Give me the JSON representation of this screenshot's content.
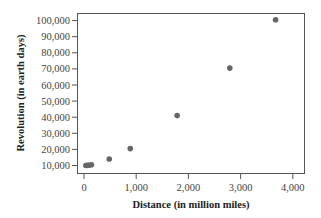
{
  "chart_data": {
    "type": "scatter",
    "title": "",
    "xlabel": "Distance (in million miles)",
    "ylabel": "Revolution (in earth days)",
    "xlim": [
      -100,
      4200
    ],
    "ylim": [
      5000,
      105000
    ],
    "grid": false,
    "legend": null,
    "x_ticks": [
      0,
      1000,
      2000,
      3000,
      4000
    ],
    "x_tick_labels": [
      "0",
      "1,000",
      "2,000",
      "3,000",
      "4,000"
    ],
    "y_ticks": [
      10000,
      20000,
      30000,
      40000,
      50000,
      60000,
      70000,
      80000,
      90000,
      100000
    ],
    "y_tick_labels": [
      "10,000",
      "20,000",
      "30,000",
      "40,000",
      "50,000",
      "60,000",
      "70,000",
      "80,000",
      "90,000",
      "100,000"
    ],
    "series": [
      {
        "name": "planets",
        "color": "#666666",
        "points": [
          {
            "x": 36,
            "y": 10000
          },
          {
            "x": 67,
            "y": 10100
          },
          {
            "x": 93,
            "y": 10200
          },
          {
            "x": 142,
            "y": 10500
          },
          {
            "x": 484,
            "y": 14000
          },
          {
            "x": 886,
            "y": 20500
          },
          {
            "x": 1784,
            "y": 41000
          },
          {
            "x": 2793,
            "y": 70500
          },
          {
            "x": 3670,
            "y": 100500
          }
        ]
      }
    ]
  }
}
